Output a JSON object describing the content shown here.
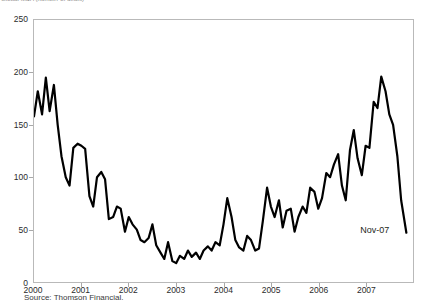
{
  "title": {
    "text": "Global M&A (number of deals)",
    "clipped": true
  },
  "source": {
    "label": "Source: Thomson Financial."
  },
  "annotations": [
    {
      "name": "last-point-label",
      "text": "Nov-07",
      "x": 2007.86,
      "y": 47
    }
  ],
  "axes": {
    "y": {
      "ticks": [
        0,
        50,
        100,
        150,
        200,
        250
      ],
      "tick_labels": [
        "0",
        "50",
        "100",
        "150",
        "200",
        "250"
      ],
      "min": 0,
      "max": 250
    },
    "x": {
      "ticks": [
        2000,
        2001,
        2002,
        2003,
        2004,
        2005,
        2006,
        2007
      ],
      "tick_labels": [
        "2000",
        "2001",
        "2002",
        "2003",
        "2004",
        "2005",
        "2006",
        "2007"
      ],
      "min": 2000,
      "max": 2008
    }
  },
  "style": {
    "line_color": "#000000",
    "frame_color": "#b9b9b9",
    "background": "#ffffff",
    "line_width": 2.2
  },
  "chart_data": {
    "type": "line",
    "title": "Global M&A (number of deals)",
    "xlabel": "",
    "ylabel": "",
    "xlim": [
      2000,
      2008
    ],
    "ylim": [
      0,
      250
    ],
    "grid": false,
    "legend": null,
    "x_tick_labels": [
      "2000",
      "2001",
      "2002",
      "2003",
      "2004",
      "2005",
      "2006",
      "2007"
    ],
    "y_tick_labels": [
      "0",
      "50",
      "100",
      "150",
      "200",
      "250"
    ],
    "series": [
      {
        "name": "Monthly value",
        "x": [
          2000.0,
          2000.08,
          2000.17,
          2000.25,
          2000.33,
          2000.42,
          2000.5,
          2000.58,
          2000.67,
          2000.75,
          2000.83,
          2000.92,
          2001.0,
          2001.08,
          2001.17,
          2001.25,
          2001.33,
          2001.42,
          2001.5,
          2001.58,
          2001.67,
          2001.75,
          2001.83,
          2001.92,
          2002.0,
          2002.08,
          2002.17,
          2002.25,
          2002.33,
          2002.42,
          2002.5,
          2002.58,
          2002.67,
          2002.75,
          2002.83,
          2002.92,
          2003.0,
          2003.08,
          2003.17,
          2003.25,
          2003.33,
          2003.42,
          2003.5,
          2003.58,
          2003.67,
          2003.75,
          2003.83,
          2003.92,
          2004.0,
          2004.08,
          2004.17,
          2004.25,
          2004.33,
          2004.42,
          2004.5,
          2004.58,
          2004.67,
          2004.75,
          2004.83,
          2004.92,
          2005.0,
          2005.08,
          2005.17,
          2005.25,
          2005.33,
          2005.42,
          2005.5,
          2005.58,
          2005.67,
          2005.75,
          2005.83,
          2005.92,
          2006.0,
          2006.08,
          2006.17,
          2006.25,
          2006.33,
          2006.42,
          2006.5,
          2006.58,
          2006.67,
          2006.75,
          2006.83,
          2006.92,
          2007.0,
          2007.08,
          2007.17,
          2007.25,
          2007.33,
          2007.42,
          2007.5,
          2007.58,
          2007.67,
          2007.75,
          2007.86
        ],
        "values": [
          158,
          182,
          160,
          195,
          163,
          188,
          150,
          120,
          100,
          92,
          128,
          132,
          130,
          127,
          82,
          72,
          100,
          105,
          98,
          60,
          62,
          72,
          70,
          48,
          62,
          55,
          50,
          40,
          38,
          42,
          55,
          35,
          28,
          22,
          38,
          20,
          18,
          25,
          22,
          30,
          24,
          28,
          22,
          30,
          34,
          30,
          38,
          35,
          55,
          80,
          62,
          40,
          33,
          30,
          44,
          40,
          30,
          32,
          58,
          90,
          72,
          62,
          78,
          52,
          68,
          70,
          48,
          62,
          72,
          66,
          90,
          86,
          70,
          80,
          104,
          100,
          112,
          122,
          92,
          78,
          126,
          145,
          118,
          102,
          130,
          128,
          172,
          166,
          196,
          182,
          160,
          150,
          120,
          78,
          47
        ]
      }
    ]
  }
}
